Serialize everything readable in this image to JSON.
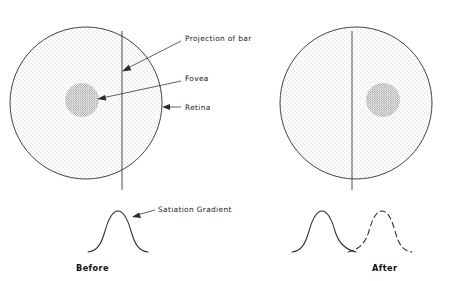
{
  "figure": {
    "background_color": "#ffffff",
    "ink_color": "#2b2b2b"
  },
  "panels": [
    {
      "id": "before",
      "caption": "Before",
      "caption_position": {
        "x": 76,
        "y": 271
      },
      "retina": {
        "label": "Retina",
        "center": {
          "x": 86,
          "y": 103
        },
        "radius": 76,
        "fill": "light-stipple"
      },
      "fovea": {
        "label": "Fovea",
        "center": {
          "x": 82,
          "y": 100
        },
        "radius": 17,
        "fill": "dense-stipple",
        "side_of_bar": "left"
      },
      "bar_projection": {
        "label": "Projection of bar",
        "x": 122,
        "y_top": 31,
        "y_bottom": 190
      },
      "gradient_curve": {
        "label": "Satiation Gradient",
        "style": "solid",
        "peak": {
          "x": 118,
          "y": 213
        },
        "baseline_y": 252
      }
    },
    {
      "id": "after",
      "caption": "After",
      "caption_position": {
        "x": 372,
        "y": 271
      },
      "retina": {
        "label": "Retina",
        "center": {
          "x": 356,
          "y": 103
        },
        "radius": 76,
        "fill": "light-stipple"
      },
      "fovea": {
        "label": "Fovea",
        "center": {
          "x": 383,
          "y": 100
        },
        "radius": 17,
        "fill": "dense-stipple",
        "side_of_bar": "right"
      },
      "bar_projection": {
        "label": "Projection of bar",
        "x": 352,
        "y_top": 31,
        "y_bottom": 190
      },
      "gradient_curves": [
        {
          "style": "solid",
          "peak": {
            "x": 322,
            "y": 213
          },
          "baseline_y": 252
        },
        {
          "style": "dashed",
          "peak": {
            "x": 382,
            "y": 213
          },
          "baseline_y": 252
        }
      ],
      "curve_crossing": {
        "x": 352,
        "y": 248
      }
    }
  ],
  "annotations": [
    {
      "id": "projection-of-bar",
      "text": "Projection of bar",
      "text_position": {
        "x": 185,
        "y": 38
      },
      "leader_from": {
        "x": 181,
        "y": 41
      },
      "leader_to": {
        "x": 124,
        "y": 70
      },
      "arrow": true
    },
    {
      "id": "fovea",
      "text": "Fovea",
      "text_position": {
        "x": 185,
        "y": 78
      },
      "leader_from": {
        "x": 181,
        "y": 81
      },
      "leader_to": {
        "x": 98,
        "y": 99
      },
      "arrow": true
    },
    {
      "id": "retina",
      "text": "Retina",
      "text_position": {
        "x": 185,
        "y": 110
      },
      "leader_from": {
        "x": 181,
        "y": 107
      },
      "leader_to": {
        "x": 163,
        "y": 107
      },
      "arrow": true
    },
    {
      "id": "satiation-gradient",
      "text": "Satiation Gradient",
      "text_position": {
        "x": 158,
        "y": 212
      },
      "leader_from": {
        "x": 155,
        "y": 210
      },
      "leader_to": {
        "x": 133,
        "y": 217
      },
      "arrow": true
    }
  ]
}
